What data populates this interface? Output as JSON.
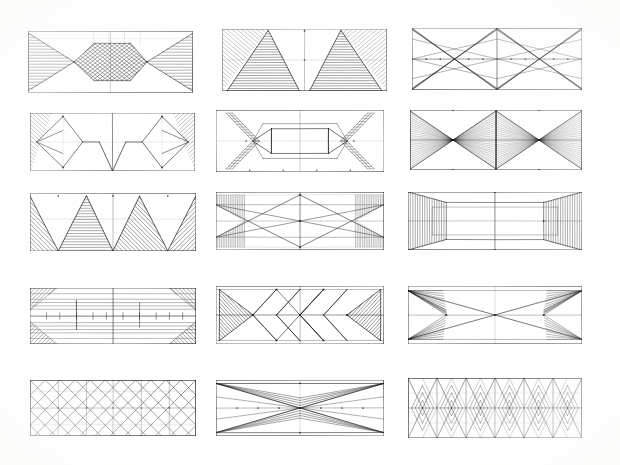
{
  "sheet": {
    "title": "Hand-drawn geometric pattern studies",
    "description": "Pencil sketch sheet of fifteen rectangular panel studies arranged in a 3 column by 5 row grid",
    "background_color": "#ffffff",
    "ink_color": "#1b1b1b",
    "light_ink_color": "#6e6e6e",
    "width": 620,
    "height": 465,
    "columns": 3,
    "rows": 5,
    "panel_count": 15
  },
  "panels": [
    {
      "id": "panel-1",
      "row": 1,
      "col": 1,
      "label": "Opposed hatched cones with central crosshatched lozenge",
      "x": 28,
      "y": 31,
      "w": 165,
      "h": 62,
      "motif": "cones-lozenge-crosshatch"
    },
    {
      "id": "panel-2",
      "row": 1,
      "col": 2,
      "label": "Twin hatched triangles rising from base with diagonal corner fill",
      "x": 222,
      "y": 29,
      "w": 165,
      "h": 62,
      "motif": "twin-triangles-hatched"
    },
    {
      "id": "panel-3",
      "row": 1,
      "col": 3,
      "label": "Mirrored multi-line X lattice with centre axis",
      "x": 412,
      "y": 28,
      "w": 170,
      "h": 62,
      "motif": "double-x-lattice"
    },
    {
      "id": "panel-4",
      "row": 2,
      "col": 1,
      "label": "Paired diamonds with corner diagonal hatching and central chevrons",
      "x": 30,
      "y": 113,
      "w": 165,
      "h": 58,
      "motif": "diamonds-corner-hatch"
    },
    {
      "id": "panel-5",
      "row": 2,
      "col": 2,
      "label": "Central rectangle between arrowheads with ladder-hatched chevron ends",
      "x": 216,
      "y": 110,
      "w": 168,
      "h": 62,
      "motif": "rectangle-arrowheads-ladder"
    },
    {
      "id": "panel-6",
      "row": 2,
      "col": 3,
      "label": "Two dense fan-hatched bowtie cells side by side",
      "x": 410,
      "y": 110,
      "w": 172,
      "h": 60,
      "motif": "double-bowtie-fan"
    },
    {
      "id": "panel-7",
      "row": 3,
      "col": 1,
      "label": "Zigzag bands of parallel diagonal hatching",
      "x": 30,
      "y": 193,
      "w": 166,
      "h": 58,
      "motif": "zigzag-diagonal-bands"
    },
    {
      "id": "panel-8",
      "row": 3,
      "col": 2,
      "label": "Crossed long diagonals with vertical ruling at ends",
      "x": 216,
      "y": 192,
      "w": 168,
      "h": 58,
      "motif": "crossed-diagonals-ruled-ends"
    },
    {
      "id": "panel-9",
      "row": 3,
      "col": 3,
      "label": "Perspective tunnel with ribbed end panels",
      "x": 408,
      "y": 192,
      "w": 174,
      "h": 58,
      "motif": "tunnel-ribbed-ends"
    },
    {
      "id": "panel-10",
      "row": 4,
      "col": 1,
      "label": "Horizontal banded panel with hatched corner wedges and tick marks",
      "x": 30,
      "y": 288,
      "w": 166,
      "h": 56,
      "motif": "banded-wedges-ticks"
    },
    {
      "id": "panel-11",
      "row": 4,
      "col": 2,
      "label": "Row of squares on point flanked by hatched triangles",
      "x": 216,
      "y": 286,
      "w": 168,
      "h": 58,
      "motif": "diamond-row-hatched-ends"
    },
    {
      "id": "panel-12",
      "row": 4,
      "col": 3,
      "label": "Radiating line fans converging to end points",
      "x": 408,
      "y": 286,
      "w": 174,
      "h": 58,
      "motif": "radiating-fans"
    },
    {
      "id": "panel-13",
      "row": 5,
      "col": 1,
      "label": "Dense overall diamond net lattice",
      "x": 30,
      "y": 380,
      "w": 166,
      "h": 56,
      "motif": "diamond-net"
    },
    {
      "id": "panel-14",
      "row": 5,
      "col": 2,
      "label": "Wide double bowtie with sparse ray lines",
      "x": 216,
      "y": 380,
      "w": 168,
      "h": 56,
      "motif": "sparse-bowtie-rays"
    },
    {
      "id": "panel-15",
      "row": 5,
      "col": 3,
      "label": "Gridded lattice with repeated nested diamond clusters",
      "x": 408,
      "y": 378,
      "w": 174,
      "h": 60,
      "motif": "gridded-nested-diamonds"
    }
  ]
}
